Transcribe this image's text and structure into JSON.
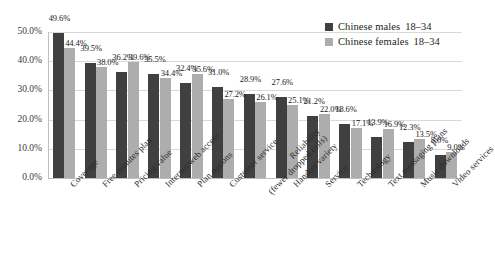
{
  "chart_data": {
    "type": "bar",
    "title": "",
    "subtitle": "",
    "xlabel": "",
    "ylabel": "",
    "ylim": [
      0,
      50
    ],
    "ytick_labels": [
      "0.0%",
      "10.0%",
      "20.0%",
      "30.0%",
      "40.0%",
      "50.0%"
    ],
    "ytick_values": [
      0,
      10,
      20,
      30,
      40,
      50
    ],
    "grid": true,
    "legend_position": "top-right",
    "categories": [
      "Coverage",
      "Free minutes plan",
      "Pricing/value",
      "Internet/web access",
      "Plan options",
      "Customer service",
      "Reliability (fewer dropped calls)",
      "Handset variety",
      "Service",
      "Technology",
      "Text messaging plans",
      "Music downloads",
      "Video services"
    ],
    "category_lines": [
      [
        "Coverage"
      ],
      [
        "Free minutes plan"
      ],
      [
        "Pricing/value"
      ],
      [
        "Internet/web access"
      ],
      [
        "Plan options"
      ],
      [
        "Customer service"
      ],
      [
        "Reliability",
        "(fewer dropped calls)"
      ],
      [
        "Handset variety"
      ],
      [
        "Service"
      ],
      [
        "Technology"
      ],
      [
        "Text messaging plans"
      ],
      [
        "Music downloads"
      ],
      [
        "Video services"
      ]
    ],
    "series": [
      {
        "name": "Chinese males",
        "age": "18–34",
        "color": "#404040",
        "values": [
          49.6,
          39.5,
          36.2,
          35.5,
          32.4,
          31.0,
          28.9,
          27.6,
          21.2,
          18.6,
          13.9,
          12.3,
          8.0
        ],
        "labels": [
          "49.6%",
          "39.5%",
          "36.2%",
          "35.5%",
          "32.4%",
          "31.0%",
          "28.9%",
          "27.6%",
          "21.2%",
          "18.6%",
          "13.9%",
          "12.3%",
          "8.0%"
        ]
      },
      {
        "name": "Chinese females",
        "age": "18–34",
        "color": "#adadad",
        "values": [
          44.4,
          38.0,
          39.6,
          34.4,
          35.6,
          27.2,
          26.1,
          25.1,
          22.0,
          17.1,
          16.9,
          13.5,
          9.0
        ],
        "labels": [
          "44.4%",
          "38.0%",
          "39.6%",
          "34.4%",
          "35.6%",
          "27.2%",
          "26.1%",
          "25.1%",
          "22.0%",
          "17.1%",
          "16.9%",
          "13.5%",
          "9.0%"
        ]
      }
    ]
  },
  "legend": {
    "items": [
      {
        "label": "Chinese males",
        "age": "18–34",
        "color": "#404040"
      },
      {
        "label": "Chinese females",
        "age": "18–34",
        "color": "#adadad"
      }
    ]
  },
  "colors": {
    "series_dark": "#404040",
    "series_light": "#adadad",
    "gridline": "#d9d9d9",
    "axis": "#bfbfbf",
    "text": "#231f20",
    "background": "#ffffff"
  }
}
